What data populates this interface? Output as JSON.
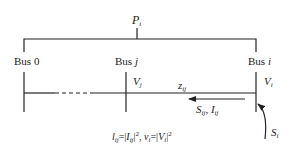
{
  "diagram": {
    "top_label": {
      "sym": "P",
      "sub": "i"
    },
    "buses": [
      {
        "prefix": "Bus ",
        "name": "0"
      },
      {
        "prefix": "Bus ",
        "name": "j"
      },
      {
        "prefix": "Bus ",
        "name": "i"
      }
    ],
    "voltages": [
      {
        "sym": "V",
        "sub": "j"
      },
      {
        "sym": "V",
        "sub": "i"
      }
    ],
    "impedance": {
      "sym": "z",
      "sub": "ij"
    },
    "flow": {
      "s": "S",
      "s_sub": "ij",
      "sep": ", ",
      "i": "I",
      "i_sub": "ij"
    },
    "injection": {
      "sym": "S",
      "sub": "i"
    },
    "formula": {
      "l": "l",
      "l_sub": "ij",
      "eq1": "=|",
      "I": "I",
      "I_sub": "ij",
      "close1": "|",
      "sq1": "2",
      "sep": ", ",
      "v": "v",
      "v_sub": "i",
      "eq2": "=|",
      "V": "V",
      "V_sub": "i",
      "close2": "|",
      "sq2": "2"
    },
    "colors": {
      "line": "#222222",
      "background": "#ffffff"
    }
  }
}
